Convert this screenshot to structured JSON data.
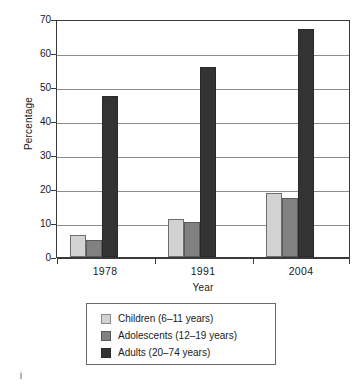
{
  "chart_data": {
    "type": "bar",
    "title": "",
    "xlabel": "Year",
    "ylabel": "Percentage",
    "categories": [
      "1978",
      "1991",
      "2004"
    ],
    "ylim": [
      0,
      70
    ],
    "yticks": [
      0,
      10,
      20,
      30,
      40,
      50,
      60,
      70
    ],
    "ytick_labels": [
      "0",
      "10",
      "20",
      "30",
      "40",
      "50",
      "60",
      "70"
    ],
    "grid": true,
    "legend_position": "bottom",
    "series": [
      {
        "name": "Children (6–11 years)",
        "color": "#d2d2d2",
        "values": [
          6.5,
          11.2,
          18.8
        ]
      },
      {
        "name": "Adolescents (12–19 years)",
        "color": "#818181",
        "values": [
          5.0,
          10.4,
          17.3
        ]
      },
      {
        "name": "Adults (20–74 years)",
        "color": "#333333",
        "values": [
          47.4,
          56.0,
          67.0
        ]
      }
    ]
  },
  "legend": {
    "items": [
      {
        "label": "Children (6–11 years)",
        "color": "#d2d2d2"
      },
      {
        "label": "Adolescents (12–19 years)",
        "color": "#818181"
      },
      {
        "label": "Adults (20–74 years)",
        "color": "#333333"
      }
    ]
  }
}
